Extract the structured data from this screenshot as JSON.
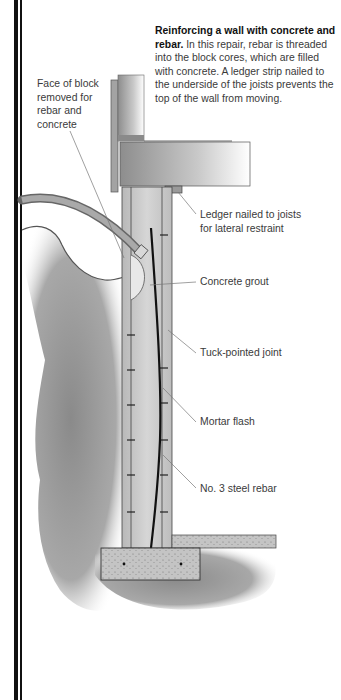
{
  "caption": {
    "title": "Reinforcing a wall with concrete and rebar.",
    "body": "In this repair, rebar is threaded into the block cores, which are filled with concrete. A ledger strip nailed to the underside of the joists prevents the top of the wall from moving."
  },
  "labels": {
    "face_of_block": [
      "Face of block",
      "removed for",
      "rebar and",
      "concrete"
    ],
    "ledger": [
      "Ledger nailed to joists",
      "for lateral restraint"
    ],
    "concrete_grout": "Concrete grout",
    "tuck_pointed": "Tuck-pointed joint",
    "mortar_flash": "Mortar flash",
    "rebar": "No. 3 steel rebar"
  },
  "colors": {
    "border": "#111111",
    "text": "#3a3a3a",
    "soil": "#9a9a9a",
    "concrete": "#c8c8c8",
    "wood": "#b5b5b5"
  }
}
